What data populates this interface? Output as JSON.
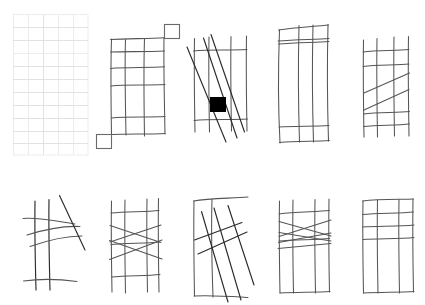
{
  "board": {
    "title": "Hand-drawn grid sketch panel",
    "background_color": "#ffffff",
    "width": 425,
    "height": 300,
    "rows": 2,
    "columns": 5,
    "panel_count": 10,
    "ink_color": "#555555",
    "ink_color_dark": "#2b2b2b",
    "faint_color": "#ececec",
    "accent_fill_color": "#000000"
  },
  "panels": [
    {
      "index": 1,
      "name": "faint-ruled-grid",
      "position": "row-1-col-1",
      "description": "Very faint light-gray ruled grid, 5 columns by 11 rows",
      "columns": 5,
      "rows": 11,
      "style": "faint",
      "has_diagonals": false,
      "has_filled_square": false,
      "has_corner_squares": false,
      "bounds": {
        "x": 13,
        "y": 14,
        "width": 75,
        "height": 141
      }
    },
    {
      "index": 2,
      "name": "grid-with-corner-squares",
      "position": "row-1-col-2",
      "description": "Hand-drawn grid with small open squares at top-right and bottom-left",
      "columns": 3,
      "rows": 5,
      "style": "sketch",
      "has_diagonals": false,
      "has_filled_square": false,
      "has_corner_squares": true,
      "corner_squares": 2,
      "bounds": {
        "x": 110,
        "y": 38,
        "width": 55,
        "height": 92
      }
    },
    {
      "index": 3,
      "name": "grid-with-diagonals-and-block",
      "position": "row-1-col-3",
      "description": "Grid with three steep diagonal strokes and one solid black square",
      "columns": 4,
      "rows": 2,
      "style": "sketch",
      "has_diagonals": true,
      "diagonal_count": 3,
      "has_filled_square": true,
      "filled_square": {
        "x": 210,
        "y": 97,
        "width": 16,
        "height": 15
      },
      "has_corner_squares": false,
      "bounds": {
        "x": 192,
        "y": 38,
        "width": 55,
        "height": 92
      }
    },
    {
      "index": 4,
      "name": "grid-vertical-dominant",
      "position": "row-1-col-4",
      "description": "Tall grid, mostly vertical strokes, horizontals clustered at top and bottom",
      "columns": 4,
      "rows": 3,
      "style": "sketch",
      "has_diagonals": false,
      "has_filled_square": false,
      "has_corner_squares": false,
      "bounds": {
        "x": 278,
        "y": 28,
        "width": 50,
        "height": 118
      }
    },
    {
      "index": 5,
      "name": "grid-with-shallow-zigzag",
      "position": "row-1-col-5",
      "description": "Grid with two shallow rising diagonal strokes in the middle band",
      "columns": 4,
      "rows": 4,
      "style": "sketch",
      "has_diagonals": true,
      "diagonal_count": 2,
      "has_filled_square": false,
      "has_corner_squares": false,
      "bounds": {
        "x": 362,
        "y": 38,
        "width": 50,
        "height": 105
      }
    },
    {
      "index": 6,
      "name": "grid-with-slash",
      "position": "row-2-col-1",
      "description": "Two tall verticals crossed by tilted horizontals and one steep slash",
      "columns": 2,
      "rows": 4,
      "style": "sketch",
      "has_diagonals": true,
      "diagonal_count": 1,
      "has_filled_square": false,
      "has_corner_squares": false,
      "bounds": {
        "x": 22,
        "y": 195,
        "width": 60,
        "height": 95
      }
    },
    {
      "index": 7,
      "name": "grid-with-lattice-cross",
      "position": "row-2-col-2",
      "description": "Grid with crossing diagonal lines forming a lattice X pattern at mid height",
      "columns": 4,
      "rows": 3,
      "style": "sketch",
      "has_diagonals": true,
      "diagonal_count": 4,
      "has_filled_square": false,
      "has_corner_squares": false,
      "bounds": {
        "x": 108,
        "y": 198,
        "width": 55,
        "height": 95
      }
    },
    {
      "index": 8,
      "name": "grid-with-steep-diagonals",
      "position": "row-2-col-3",
      "description": "Grid crossed by four long steep diagonal strokes running top-left to bottom-right",
      "columns": 2,
      "rows": 3,
      "style": "sketch",
      "has_diagonals": true,
      "diagonal_count": 4,
      "has_filled_square": false,
      "has_corner_squares": false,
      "bounds": {
        "x": 193,
        "y": 198,
        "width": 55,
        "height": 98
      }
    },
    {
      "index": 9,
      "name": "grid-with-upper-cross",
      "position": "row-2-col-4",
      "description": "Grid with dense crossing X strokes concentrated in the upper third",
      "columns": 4,
      "rows": 3,
      "style": "sketch",
      "has_diagonals": true,
      "diagonal_count": 5,
      "has_filled_square": false,
      "has_corner_squares": false,
      "bounds": {
        "x": 278,
        "y": 198,
        "width": 55,
        "height": 95
      }
    },
    {
      "index": 10,
      "name": "grid-top-banded",
      "position": "row-2-col-5",
      "description": "Plain grid with three horizontal bands clustered near the top",
      "columns": 3,
      "rows": 4,
      "style": "sketch",
      "has_diagonals": false,
      "has_filled_square": false,
      "has_corner_squares": false,
      "bounds": {
        "x": 362,
        "y": 198,
        "width": 52,
        "height": 93
      }
    }
  ]
}
